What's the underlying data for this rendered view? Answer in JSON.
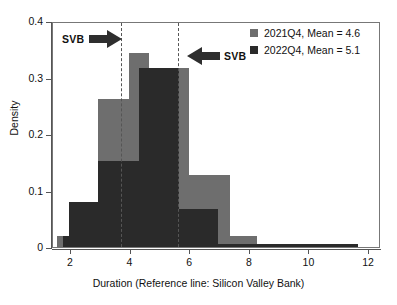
{
  "chart_data": {
    "type": "bar",
    "subtype": "overlaid-histogram",
    "title": "",
    "xlabel": "Duration (Reference line: Silicon Valley Bank)",
    "ylabel": "Density",
    "xlim": [
      1.4,
      12.4
    ],
    "ylim": [
      0,
      0.4
    ],
    "grid": false,
    "legend_position": "top-right",
    "x_ticks": [
      "2",
      "4",
      "6",
      "8",
      "10",
      "12"
    ],
    "x_tick_values": [
      2,
      4,
      6,
      8,
      10,
      12
    ],
    "y_ticks": [
      "0",
      "0.1",
      "0.2",
      "0.3",
      "0.4"
    ],
    "y_tick_values": [
      0,
      0.1,
      0.2,
      0.3,
      0.4
    ],
    "bin_width": 0.66,
    "series": [
      {
        "name": "2021Q4, Mean = 4.6",
        "short_name": "2021Q4",
        "mean": 4.6,
        "color": "#6e6e6e",
        "bins": [
          {
            "x0": 1.55,
            "x1": 1.95,
            "value": 0.02
          },
          {
            "x0": 1.95,
            "x1": 2.92,
            "value": 0.08
          },
          {
            "x0": 2.92,
            "x1": 3.95,
            "value": 0.262
          },
          {
            "x0": 3.95,
            "x1": 4.62,
            "value": 0.344
          },
          {
            "x0": 4.62,
            "x1": 5.95,
            "value": 0.317
          },
          {
            "x0": 5.95,
            "x1": 7.35,
            "value": 0.127
          },
          {
            "x0": 7.35,
            "x1": 8.25,
            "value": 0.02
          }
        ]
      },
      {
        "name": "2022Q4, Mean = 5.1",
        "short_name": "2022Q4",
        "mean": 5.1,
        "color": "#2a2a2a",
        "bins": [
          {
            "x0": 1.72,
            "x1": 1.95,
            "value": 0.02
          },
          {
            "x0": 1.95,
            "x1": 2.92,
            "value": 0.08
          },
          {
            "x0": 2.92,
            "x1": 4.28,
            "value": 0.152
          },
          {
            "x0": 4.28,
            "x1": 5.62,
            "value": 0.317
          },
          {
            "x0": 5.62,
            "x1": 6.95,
            "value": 0.067
          },
          {
            "x0": 6.95,
            "x1": 11.62,
            "value": 0.006
          }
        ]
      }
    ],
    "reference_lines": [
      {
        "label": "SVB",
        "x": 3.68,
        "style": "dashed",
        "color": "#555555"
      },
      {
        "label": "SVB",
        "x": 5.58,
        "style": "dashed",
        "color": "#555555"
      }
    ],
    "annotations": [
      {
        "label": "SVB",
        "arrow": "right",
        "target_x": 3.68
      },
      {
        "label": "SVB",
        "arrow": "left",
        "target_x": 5.58
      }
    ]
  },
  "legend": {
    "entries": [
      {
        "label": "2021Q4, Mean = 4.6"
      },
      {
        "label": "2022Q4, Mean = 5.1"
      }
    ]
  },
  "axes": {
    "y_title": "Density",
    "x_title": "Duration (Reference line: Silicon Valley Bank)",
    "y_labels": [
      "0.4",
      "0.3",
      "0.2",
      "0.1",
      "0"
    ],
    "x_labels": [
      "2",
      "4",
      "6",
      "8",
      "10",
      "12"
    ]
  },
  "annotations": {
    "left": {
      "label": "SVB"
    },
    "right": {
      "label": "SVB"
    }
  }
}
